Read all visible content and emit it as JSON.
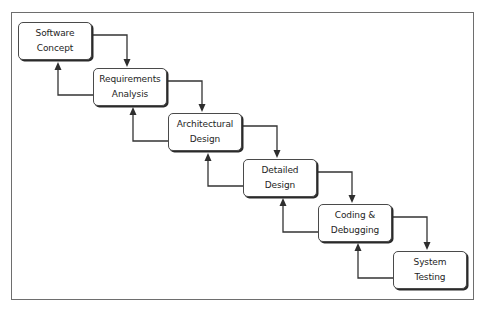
{
  "diagram": {
    "type": "waterfall-process",
    "title": "",
    "colors": {
      "frame": "#6e6e6e",
      "box_border": "#4a4a4a",
      "box_shadow": "#2a2a2a",
      "arrow": "#333333",
      "text": "#1e1e1e",
      "background": "#ffffff"
    },
    "stages": [
      {
        "id": "software-concept",
        "line1": "Software",
        "line2": "Concept"
      },
      {
        "id": "requirements-analysis",
        "line1": "Requirements",
        "line2": "Analysis"
      },
      {
        "id": "architectural-design",
        "line1": "Architectural",
        "line2": "Design"
      },
      {
        "id": "detailed-design",
        "line1": "Detailed",
        "line2": "Design"
      },
      {
        "id": "coding-debugging",
        "line1": "Coding &",
        "line2": "Debugging"
      },
      {
        "id": "system-testing",
        "line1": "System",
        "line2": "Testing"
      }
    ],
    "edges": [
      {
        "from": "software-concept",
        "to": "requirements-analysis",
        "direction": "forward"
      },
      {
        "from": "requirements-analysis",
        "to": "software-concept",
        "direction": "feedback"
      },
      {
        "from": "requirements-analysis",
        "to": "architectural-design",
        "direction": "forward"
      },
      {
        "from": "architectural-design",
        "to": "requirements-analysis",
        "direction": "feedback"
      },
      {
        "from": "architectural-design",
        "to": "detailed-design",
        "direction": "forward"
      },
      {
        "from": "detailed-design",
        "to": "architectural-design",
        "direction": "feedback"
      },
      {
        "from": "detailed-design",
        "to": "coding-debugging",
        "direction": "forward"
      },
      {
        "from": "coding-debugging",
        "to": "detailed-design",
        "direction": "feedback"
      },
      {
        "from": "coding-debugging",
        "to": "system-testing",
        "direction": "forward"
      },
      {
        "from": "system-testing",
        "to": "coding-debugging",
        "direction": "feedback"
      }
    ]
  }
}
